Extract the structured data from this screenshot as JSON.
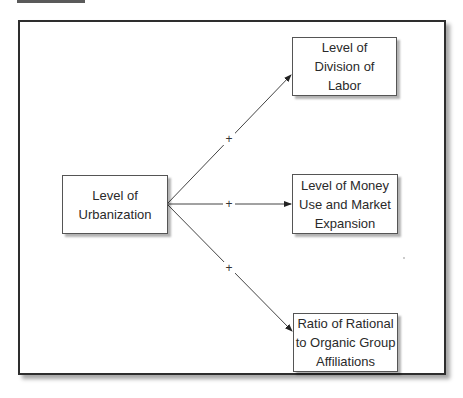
{
  "diagram": {
    "type": "causal-model",
    "source_node": {
      "id": "urbanization",
      "label": "Level of\nUrbanization"
    },
    "target_nodes": [
      {
        "id": "division-of-labor",
        "label": "Level of\nDivision of\nLabor"
      },
      {
        "id": "money-use",
        "label": "Level of Money\nUse and Market\nExpansion"
      },
      {
        "id": "rational-organic",
        "label": "Ratio of Rational\nto Organic Group\nAffiliations"
      }
    ],
    "edges": [
      {
        "from": "urbanization",
        "to": "division-of-labor",
        "sign": "+"
      },
      {
        "from": "urbanization",
        "to": "money-use",
        "sign": "+"
      },
      {
        "from": "urbanization",
        "to": "rational-organic",
        "sign": "+"
      }
    ],
    "colors": {
      "line": "#333333",
      "frame": "#2e2e2e",
      "header_tab": "#5a5a5a"
    }
  }
}
